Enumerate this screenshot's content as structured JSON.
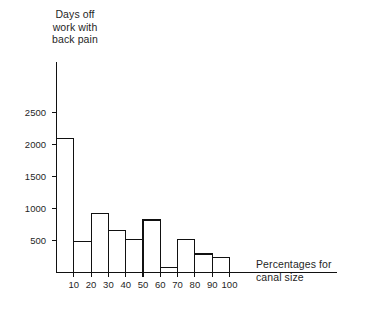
{
  "chart_data": {
    "type": "bar",
    "title": "",
    "ylabel": "Days off\nwork with\nback pain",
    "xlabel": "Percentages for\ncanal size",
    "categories": [
      "0-10",
      "10-20",
      "20-30",
      "30-40",
      "40-50",
      "50-60",
      "60-70",
      "70-80",
      "80-90",
      "90-100"
    ],
    "values": [
      2100,
      480,
      920,
      650,
      520,
      820,
      80,
      510,
      290,
      230
    ],
    "x_tick_labels": [
      "10",
      "20",
      "30",
      "40",
      "50",
      "60",
      "70",
      "80",
      "90",
      "100"
    ],
    "y_tick_labels": [
      "2500",
      "2000",
      "1500",
      "1000",
      "500"
    ],
    "y_tick_values": [
      2500,
      2000,
      1500,
      1000,
      500
    ],
    "ylim": [
      0,
      2800
    ],
    "xlim": [
      0,
      100
    ],
    "grid": false,
    "legend": null,
    "bar_fill": "#ffffff",
    "bar_stroke": "#111111",
    "axis_color": "#111111",
    "background": "#ffffff"
  },
  "labels": {
    "y_axis_title": "Days off\nwork with\nback pain",
    "x_axis_title": "Percentages for\ncanal size"
  }
}
